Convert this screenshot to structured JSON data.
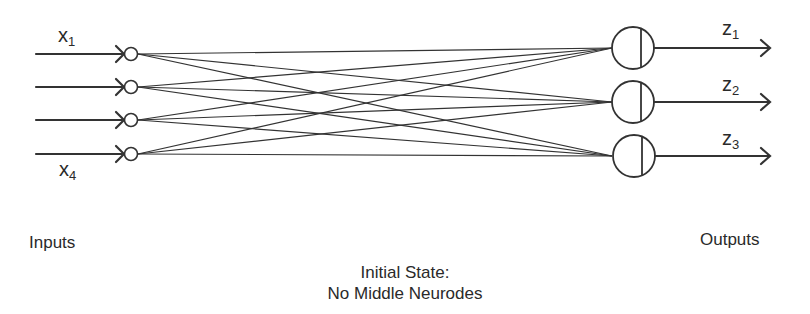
{
  "diagram": {
    "title_line1": "Initial State:",
    "title_line2": "No Middle Neurodes",
    "inputs_label": "Inputs",
    "outputs_label": "Outputs",
    "input_vars": [
      {
        "base": "x",
        "sub": "1"
      },
      {
        "base": "x",
        "sub": "4"
      }
    ],
    "output_vars": [
      {
        "base": "z",
        "sub": "1"
      },
      {
        "base": "z",
        "sub": "2"
      },
      {
        "base": "z",
        "sub": "3"
      }
    ],
    "input_nodes_count": 4,
    "output_nodes_count": 3,
    "connections": "fully connected (4 inputs x 3 outputs)",
    "colors": {
      "stroke": "#333333",
      "background": "#ffffff"
    }
  }
}
